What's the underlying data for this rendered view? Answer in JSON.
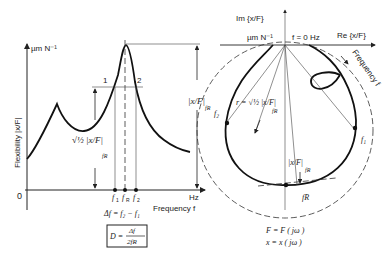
{
  "left_plot": {
    "y_unit": "µm N⁻¹",
    "y_axis_label": "Flexibility |x/F|",
    "origin_label": "0",
    "x_unit": "Hz",
    "x_axis_label": "Frequency f",
    "point_labels": [
      "1",
      "2"
    ],
    "freq_labels": [
      "f",
      "f",
      "f"
    ],
    "freq_subs": [
      "1",
      "R",
      "2"
    ],
    "half_power_label": "√½ |x/F|",
    "half_power_sub": "fR",
    "peak_label": "|x/F|",
    "peak_sub": "fR",
    "delta_eq": "Δf = f₂ − f₁",
    "damping_eq_lhs": "D =",
    "damping_eq_num": "Δf",
    "damping_eq_den": "2fR"
  },
  "right_plot": {
    "im_label": "Im {x/F}",
    "re_label": "Re {x/F}",
    "unit": "µm N⁻¹",
    "f0_label": "f = 0 Hz",
    "freq_arrow_label": "Frequency f",
    "radius_label": "r = √½ |x/F|",
    "radius_sub": "fR",
    "mag_label": "|x/F|",
    "mag_sub": "fR",
    "f1": "f₁",
    "f2": "f₂",
    "fR": "fR",
    "eq1": "F = F ( jω )",
    "eq2": "x = x ( jω )"
  }
}
